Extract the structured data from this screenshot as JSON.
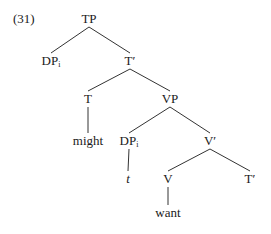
{
  "example_number": "(31)",
  "tree": {
    "nodes": [
      {
        "id": "TP",
        "label": "TP",
        "sub": "",
        "x": 89,
        "y": 12
      },
      {
        "id": "DP1",
        "label": "DP",
        "sub": "i",
        "x": 51,
        "y": 54
      },
      {
        "id": "Tbar1",
        "label": "T′",
        "sub": "",
        "x": 130,
        "y": 54
      },
      {
        "id": "T",
        "label": "T",
        "sub": "",
        "x": 88,
        "y": 92
      },
      {
        "id": "VP",
        "label": "VP",
        "sub": "",
        "x": 170,
        "y": 92
      },
      {
        "id": "might",
        "label": "might",
        "sub": "",
        "x": 88,
        "y": 134
      },
      {
        "id": "DP2",
        "label": "DP",
        "sub": "i",
        "x": 129,
        "y": 134
      },
      {
        "id": "Vbar",
        "label": "V′",
        "sub": "",
        "x": 210,
        "y": 134
      },
      {
        "id": "t",
        "label": "t",
        "sub": "",
        "x": 128,
        "y": 172,
        "italic": true
      },
      {
        "id": "V",
        "label": "V",
        "sub": "",
        "x": 168,
        "y": 172
      },
      {
        "id": "Tbar2",
        "label": "T′",
        "sub": "",
        "x": 250,
        "y": 172
      },
      {
        "id": "want",
        "label": "want",
        "sub": "",
        "x": 168,
        "y": 206
      }
    ],
    "edges": [
      [
        "TP",
        "DP1"
      ],
      [
        "TP",
        "Tbar1"
      ],
      [
        "Tbar1",
        "T"
      ],
      [
        "Tbar1",
        "VP"
      ],
      [
        "T",
        "might"
      ],
      [
        "VP",
        "DP2"
      ],
      [
        "VP",
        "Vbar"
      ],
      [
        "DP2",
        "t"
      ],
      [
        "Vbar",
        "V"
      ],
      [
        "Vbar",
        "Tbar2"
      ],
      [
        "V",
        "want"
      ]
    ],
    "line_color": "#333333"
  }
}
